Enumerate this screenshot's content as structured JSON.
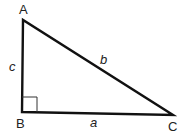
{
  "diagram": {
    "type": "right-triangle",
    "vertices": [
      {
        "label": "A",
        "x": 23,
        "y": 20
      },
      {
        "label": "B",
        "x": 22,
        "y": 112
      },
      {
        "label": "C",
        "x": 173,
        "y": 115
      }
    ],
    "sides": [
      {
        "label": "c",
        "between": "A-B"
      },
      {
        "label": "b",
        "between": "A-C"
      },
      {
        "label": "a",
        "between": "B-C"
      }
    ],
    "right_angle_at": "B",
    "stroke_color": "#111111"
  }
}
